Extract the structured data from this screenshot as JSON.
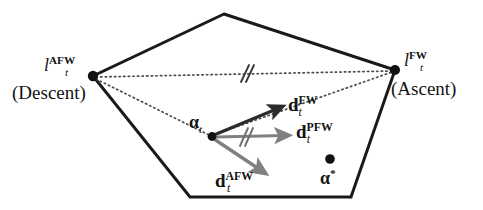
{
  "figure": {
    "type": "diagram",
    "background": "#ffffff",
    "ink_color": "#1a1a1a",
    "gray_color": "#7d7d7d",
    "dotted_color": "#4d4d4d"
  },
  "labels": {
    "vertex_left": {
      "base": "l",
      "sub": "t",
      "sup": "AFW"
    },
    "vertex_left_note": "(Descent)",
    "vertex_right": {
      "base": "l",
      "sub": "t",
      "sup": "FW"
    },
    "vertex_right_note": "(Ascent)",
    "iterate": {
      "base": "α",
      "sub": "t"
    },
    "optimum": "α",
    "optimum_star": "*",
    "dir_fw": {
      "base": "d",
      "sub": "t",
      "sup": "FW"
    },
    "dir_pfw": {
      "base": "d",
      "sub": "t",
      "sup": "PFW"
    },
    "dir_afw": {
      "base": "d",
      "sub": "t",
      "sup": "AFW"
    },
    "tick_top": "//",
    "tick_pfw": "//"
  },
  "geometry": {
    "polygon_points": "224,14 395,70 351,197 190,197 93,76",
    "vertices": [
      {
        "name": "apex",
        "x": 224,
        "y": 14
      },
      {
        "name": "right-fw",
        "x": 395,
        "y": 70
      },
      {
        "name": "bottom-right",
        "x": 351,
        "y": 197
      },
      {
        "name": "bottom-left",
        "x": 190,
        "y": 197
      },
      {
        "name": "left-afw",
        "x": 93,
        "y": 76
      }
    ],
    "points": [
      {
        "name": "alpha-t",
        "x": 212,
        "y": 136
      },
      {
        "name": "alpha-star",
        "x": 330,
        "y": 159
      },
      {
        "name": "vertex-left-dot",
        "x": 93,
        "y": 76
      },
      {
        "name": "vertex-right-dot",
        "x": 395,
        "y": 70
      }
    ],
    "dotted_lines": [
      {
        "name": "left-to-right",
        "x1": 96,
        "y1": 77,
        "x2": 392,
        "y2": 71
      },
      {
        "name": "left-to-alpha",
        "x1": 96,
        "y1": 79,
        "x2": 209,
        "y2": 135
      },
      {
        "name": "alpha-to-right",
        "x1": 215,
        "y1": 134,
        "x2": 392,
        "y2": 72
      }
    ],
    "arrows": [
      {
        "name": "fw",
        "x1": 214,
        "y1": 135,
        "x2": 284,
        "y2": 106,
        "color": "#2b2b2b",
        "width": 3.2
      },
      {
        "name": "pfw",
        "x1": 215,
        "y1": 137,
        "x2": 290,
        "y2": 135,
        "color": "#808080",
        "width": 3.2
      },
      {
        "name": "afw",
        "x1": 214,
        "y1": 139,
        "x2": 267,
        "y2": 175,
        "color": "#808080",
        "width": 3.4
      }
    ]
  },
  "chart_data": {
    "type": "diagram",
    "annotations": [
      "l_t^AFW (Descent)",
      "l_t^FW (Ascent)",
      "alpha_t",
      "d_t^FW",
      "d_t^PFW",
      "d_t^AFW",
      "alpha^*"
    ]
  }
}
